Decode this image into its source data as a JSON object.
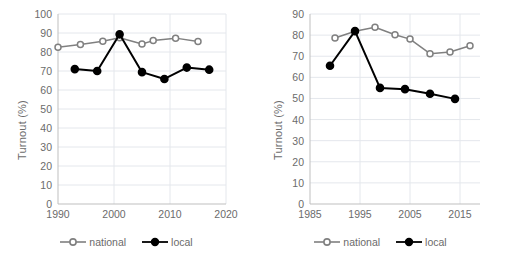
{
  "chart_data": [
    {
      "type": "line",
      "panel": "left",
      "title": "",
      "xlabel": "",
      "ylabel": "Turnout (%)",
      "xlim": [
        1990,
        2020
      ],
      "ylim": [
        0,
        100
      ],
      "xticks": [
        1990,
        2000,
        2010,
        2020
      ],
      "yticks": [
        0,
        10,
        20,
        30,
        40,
        50,
        60,
        70,
        80,
        90,
        100
      ],
      "grid": true,
      "legend_position": "bottom",
      "series": [
        {
          "name": "national",
          "marker": "open-circle",
          "color": "#808080",
          "points": [
            {
              "x": 1990,
              "y": 82.5
            },
            {
              "x": 1994,
              "y": 84.0
            },
            {
              "x": 1998,
              "y": 85.7
            },
            {
              "x": 2001,
              "y": 87.5
            },
            {
              "x": 2005,
              "y": 84.2
            },
            {
              "x": 2007,
              "y": 86.0
            },
            {
              "x": 2011,
              "y": 87.3
            },
            {
              "x": 2015,
              "y": 85.5
            }
          ]
        },
        {
          "name": "local",
          "marker": "filled-circle",
          "color": "#000000",
          "points": [
            {
              "x": 1993,
              "y": 71.0
            },
            {
              "x": 1997,
              "y": 70.0
            },
            {
              "x": 2001,
              "y": 89.3
            },
            {
              "x": 2005,
              "y": 69.4
            },
            {
              "x": 2009,
              "y": 65.8
            },
            {
              "x": 2013,
              "y": 71.8
            },
            {
              "x": 2017,
              "y": 70.7
            }
          ]
        }
      ]
    },
    {
      "type": "line",
      "panel": "right",
      "title": "",
      "xlabel": "",
      "ylabel": "Turnout (%)",
      "xlim": [
        1985,
        2019
      ],
      "ylim": [
        0,
        90
      ],
      "xticks": [
        1985,
        1995,
        2005,
        2015
      ],
      "yticks": [
        0,
        10,
        20,
        30,
        40,
        50,
        60,
        70,
        80,
        90
      ],
      "grid": true,
      "legend_position": "bottom",
      "series": [
        {
          "name": "national",
          "marker": "open-circle",
          "color": "#808080",
          "points": [
            {
              "x": 1990,
              "y": 78.6
            },
            {
              "x": 1994,
              "y": 81.8
            },
            {
              "x": 1998,
              "y": 83.7
            },
            {
              "x": 2002,
              "y": 80.2
            },
            {
              "x": 2005,
              "y": 78.1
            },
            {
              "x": 2009,
              "y": 71.2
            },
            {
              "x": 2013,
              "y": 72.0
            },
            {
              "x": 2017,
              "y": 75.0
            }
          ]
        },
        {
          "name": "local",
          "marker": "filled-circle",
          "color": "#000000",
          "points": [
            {
              "x": 1989,
              "y": 65.5
            },
            {
              "x": 1994,
              "y": 81.9
            },
            {
              "x": 1999,
              "y": 55.0
            },
            {
              "x": 2004,
              "y": 54.4
            },
            {
              "x": 2009,
              "y": 52.2
            },
            {
              "x": 2014,
              "y": 49.8
            }
          ]
        }
      ]
    }
  ],
  "legend": {
    "national_label": "national",
    "local_label": "local"
  },
  "colors": {
    "national": "#808080",
    "local": "#000000",
    "grid": "#e4e7ec",
    "axis": "#bfbfbf",
    "text": "#6b6b6b"
  }
}
